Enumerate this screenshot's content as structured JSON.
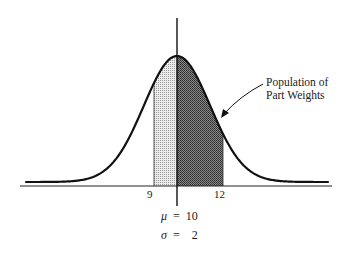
{
  "figure": {
    "annotation": [
      "Population of",
      "Part Weights"
    ],
    "tick_labels": {
      "left": "9",
      "right": "12"
    },
    "params": {
      "mu_symbol": "μ",
      "mu_eq": "=",
      "mu_value": "10",
      "sigma_symbol": "σ",
      "sigma_eq": "=",
      "sigma_value": "2"
    },
    "colors": {
      "line": "#111111",
      "light_shade": "#c8c8c8",
      "dark_shade": "#6e6e6e"
    }
  },
  "chart_data": {
    "type": "area",
    "distribution": "normal",
    "mean": 10,
    "std_dev": 2,
    "shaded_regions": [
      {
        "from": 9,
        "to": 10,
        "style": "light stipple"
      },
      {
        "from": 10,
        "to": 12,
        "style": "dark crosshatch"
      }
    ],
    "tick_labels": [
      "9",
      "12"
    ],
    "annotations": [
      "Population of Part Weights"
    ],
    "xlabel": "",
    "ylabel": "",
    "grid": false
  }
}
